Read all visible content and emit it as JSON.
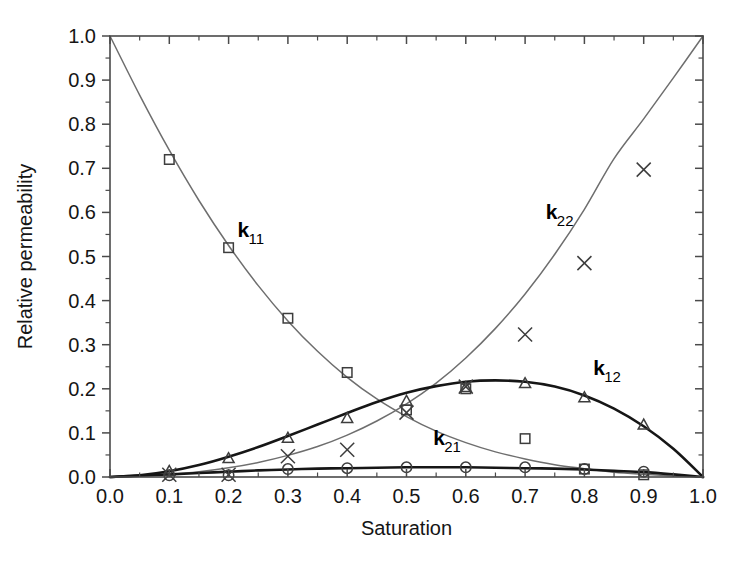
{
  "chart_data": {
    "type": "line",
    "title": "",
    "xlabel": "Saturation",
    "ylabel": "Relative permeability",
    "xlim": [
      0.0,
      1.0
    ],
    "ylim": [
      0.0,
      1.0
    ],
    "grid": false,
    "legend_position": "inline-annotations",
    "xticks": [
      "0.0",
      "0.1",
      "0.2",
      "0.3",
      "0.4",
      "0.5",
      "0.6",
      "0.7",
      "0.8",
      "0.9",
      "1.0"
    ],
    "xtick_values": [
      0.0,
      0.1,
      0.2,
      0.3,
      0.4,
      0.5,
      0.6,
      0.7,
      0.8,
      0.9,
      1.0
    ],
    "yticks": [
      "0.0",
      "0.1",
      "0.2",
      "0.3",
      "0.4",
      "0.5",
      "0.6",
      "0.7",
      "0.8",
      "0.9",
      "1.0"
    ],
    "ytick_values": [
      0.0,
      0.1,
      0.2,
      0.3,
      0.4,
      0.5,
      0.6,
      0.7,
      0.8,
      0.9,
      1.0
    ],
    "minor_tick_step": 0.05,
    "series": [
      {
        "name": "k11",
        "label_main": "k",
        "label_sub": "11",
        "marker": "square",
        "line_style": "thin",
        "color": "#6e6e6e",
        "label_x": 0.215,
        "label_y": 0.545,
        "curve": {
          "x": [
            0.0,
            0.05,
            0.1,
            0.15,
            0.2,
            0.25,
            0.3,
            0.35,
            0.4,
            0.45,
            0.5,
            0.55,
            0.6,
            0.65,
            0.7,
            0.75,
            0.8,
            0.85,
            0.9,
            0.95,
            1.0
          ],
          "y": [
            1.0,
            0.866,
            0.741,
            0.627,
            0.525,
            0.434,
            0.354,
            0.285,
            0.226,
            0.177,
            0.137,
            0.104,
            0.078,
            0.057,
            0.041,
            0.028,
            0.019,
            0.011,
            0.006,
            0.002,
            0.0
          ]
        },
        "points": {
          "x": [
            0.1,
            0.2,
            0.3,
            0.4,
            0.5,
            0.6,
            0.7,
            0.8,
            0.9
          ],
          "y": [
            0.72,
            0.52,
            0.36,
            0.237,
            0.152,
            0.2,
            0.087,
            0.018,
            0.005
          ]
        }
      },
      {
        "name": "k22",
        "label_main": "k",
        "label_sub": "22",
        "marker": "cross",
        "line_style": "thin",
        "color": "#6e6e6e",
        "label_x": 0.735,
        "label_y": 0.585,
        "curve": {
          "x": [
            0.0,
            0.05,
            0.1,
            0.15,
            0.2,
            0.25,
            0.3,
            0.35,
            0.4,
            0.45,
            0.5,
            0.55,
            0.6,
            0.65,
            0.7,
            0.75,
            0.8,
            0.85,
            0.9,
            0.95,
            1.0
          ],
          "y": [
            0.0,
            0.002,
            0.006,
            0.012,
            0.021,
            0.033,
            0.049,
            0.069,
            0.095,
            0.127,
            0.166,
            0.213,
            0.27,
            0.337,
            0.415,
            0.505,
            0.607,
            0.722,
            0.812,
            0.905,
            1.0
          ]
        },
        "points": {
          "x": [
            0.1,
            0.2,
            0.3,
            0.4,
            0.5,
            0.6,
            0.7,
            0.8,
            0.9
          ],
          "y": [
            0.005,
            0.005,
            0.047,
            0.062,
            0.146,
            0.205,
            0.323,
            0.485,
            0.697
          ]
        }
      },
      {
        "name": "k12",
        "label_main": "k",
        "label_sub": "12",
        "marker": "triangle",
        "line_style": "thick",
        "color": "#161616",
        "label_x": 0.815,
        "label_y": 0.232,
        "curve": {
          "x": [
            0.0,
            0.05,
            0.1,
            0.15,
            0.2,
            0.25,
            0.3,
            0.35,
            0.4,
            0.45,
            0.5,
            0.55,
            0.6,
            0.65,
            0.7,
            0.75,
            0.8,
            0.85,
            0.9,
            0.95,
            1.0
          ],
          "y": [
            0.0,
            0.004,
            0.013,
            0.027,
            0.046,
            0.068,
            0.093,
            0.119,
            0.145,
            0.17,
            0.191,
            0.206,
            0.216,
            0.219,
            0.216,
            0.205,
            0.185,
            0.155,
            0.115,
            0.064,
            0.0
          ]
        },
        "points": {
          "x": [
            0.1,
            0.2,
            0.3,
            0.4,
            0.5,
            0.6,
            0.7,
            0.8,
            0.9
          ],
          "y": [
            0.013,
            0.042,
            0.088,
            0.133,
            0.172,
            0.203,
            0.212,
            0.18,
            0.118
          ]
        }
      },
      {
        "name": "k21",
        "label_main": "k",
        "label_sub": "21",
        "marker": "circle",
        "line_style": "thick",
        "color": "#161616",
        "label_x": 0.545,
        "label_y": 0.073,
        "curve": {
          "x": [
            0.0,
            0.05,
            0.1,
            0.15,
            0.2,
            0.25,
            0.3,
            0.35,
            0.4,
            0.45,
            0.5,
            0.55,
            0.6,
            0.65,
            0.7,
            0.75,
            0.8,
            0.85,
            0.9,
            0.95,
            1.0
          ],
          "y": [
            0.0,
            0.003,
            0.006,
            0.009,
            0.012,
            0.015,
            0.017,
            0.019,
            0.02,
            0.021,
            0.022,
            0.022,
            0.022,
            0.021,
            0.02,
            0.019,
            0.017,
            0.014,
            0.011,
            0.006,
            0.0
          ]
        },
        "points": {
          "x": [
            0.1,
            0.2,
            0.3,
            0.4,
            0.5,
            0.6,
            0.7,
            0.8,
            0.9
          ],
          "y": [
            0.004,
            0.004,
            0.018,
            0.02,
            0.022,
            0.022,
            0.022,
            0.018,
            0.012
          ]
        }
      }
    ]
  }
}
